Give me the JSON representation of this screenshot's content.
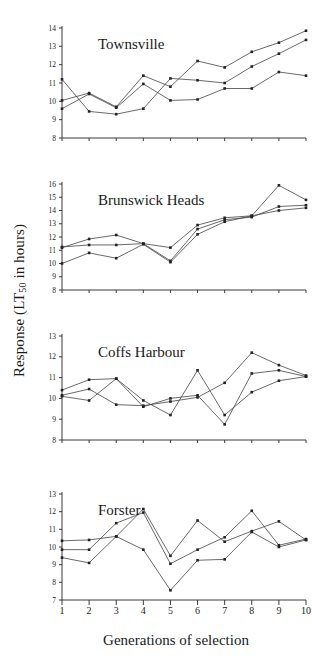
{
  "figure": {
    "ylabel_prefix": "Response (LT",
    "ylabel_sub": "50",
    "ylabel_suffix": " in hours)",
    "xlabel": "Generations of selection"
  },
  "chart_data": [
    {
      "type": "line",
      "title": "Townsville",
      "xlabel": "Generations of selection",
      "ylabel": "Response (LT50 in hours)",
      "x": [
        1,
        2,
        3,
        4,
        5,
        6,
        7,
        8,
        9,
        10
      ],
      "xlim": [
        1,
        10
      ],
      "ylim": [
        8,
        14
      ],
      "yticks": [
        8,
        9,
        10,
        11,
        12,
        13,
        14
      ],
      "xticks": [
        1,
        2,
        3,
        4,
        5,
        6,
        7,
        8,
        9,
        10
      ],
      "grid": false,
      "legend": "none",
      "series": [
        {
          "name": "line-1",
          "values": [
            11.2,
            9.45,
            9.3,
            9.6,
            11.25,
            11.15,
            11.0,
            11.9,
            12.6,
            13.35
          ]
        },
        {
          "name": "line-2",
          "values": [
            10.05,
            10.45,
            9.7,
            11.4,
            10.8,
            12.2,
            11.85,
            12.7,
            13.2,
            13.85
          ]
        },
        {
          "name": "line-3",
          "values": [
            9.6,
            10.4,
            9.65,
            10.95,
            10.05,
            10.1,
            10.7,
            10.7,
            11.6,
            11.4
          ]
        }
      ]
    },
    {
      "type": "line",
      "title": "Brunswick Heads",
      "xlabel": "Generations of selection",
      "ylabel": "Response (LT50 in hours)",
      "x": [
        1,
        2,
        3,
        4,
        5,
        6,
        7,
        8,
        9,
        10
      ],
      "xlim": [
        1,
        10
      ],
      "ylim": [
        8,
        16
      ],
      "yticks": [
        8,
        9,
        10,
        11,
        12,
        13,
        14,
        15,
        16
      ],
      "xticks": [
        1,
        2,
        3,
        4,
        5,
        6,
        7,
        8,
        9,
        10
      ],
      "grid": false,
      "legend": "none",
      "series": [
        {
          "name": "line-1",
          "values": [
            11.2,
            11.85,
            12.15,
            11.5,
            11.2,
            12.9,
            13.45,
            13.6,
            15.9,
            14.8
          ]
        },
        {
          "name": "line-2",
          "values": [
            11.25,
            11.4,
            11.4,
            11.5,
            10.2,
            12.6,
            13.3,
            13.5,
            14.3,
            14.4
          ]
        },
        {
          "name": "line-3",
          "values": [
            10.0,
            10.8,
            10.4,
            11.45,
            10.1,
            12.2,
            13.15,
            13.6,
            14.0,
            14.2
          ]
        }
      ]
    },
    {
      "type": "line",
      "title": "Coffs Harbour",
      "xlabel": "Generations of selection",
      "ylabel": "Response (LT50 in hours)",
      "x": [
        1,
        2,
        3,
        4,
        5,
        6,
        7,
        8,
        9,
        10
      ],
      "xlim": [
        1,
        10
      ],
      "ylim": [
        8,
        13
      ],
      "yticks": [
        8,
        9,
        10,
        11,
        12,
        13
      ],
      "xticks": [
        1,
        2,
        3,
        4,
        5,
        6,
        7,
        8,
        9,
        10
      ],
      "grid": false,
      "legend": "none",
      "series": [
        {
          "name": "line-1",
          "values": [
            10.4,
            10.9,
            10.95,
            9.9,
            9.2,
            11.35,
            9.2,
            10.3,
            10.85,
            11.05
          ]
        },
        {
          "name": "line-2",
          "values": [
            10.15,
            10.45,
            9.7,
            9.65,
            9.85,
            10.05,
            10.75,
            12.2,
            11.6,
            11.1
          ]
        },
        {
          "name": "line-3",
          "values": [
            10.1,
            9.9,
            10.95,
            9.6,
            10.0,
            10.15,
            8.75,
            11.2,
            11.35,
            11.05
          ]
        }
      ]
    },
    {
      "type": "line",
      "title": "Forster",
      "xlabel": "Generations of selection",
      "ylabel": "Response (LT50 in hours)",
      "x": [
        1,
        2,
        3,
        4,
        5,
        6,
        7,
        8,
        9,
        10
      ],
      "xlim": [
        1,
        10
      ],
      "ylim": [
        7,
        13
      ],
      "yticks": [
        7,
        8,
        9,
        10,
        11,
        12,
        13
      ],
      "xticks": [
        1,
        2,
        3,
        4,
        5,
        6,
        7,
        8,
        9,
        10
      ],
      "grid": false,
      "legend": "none",
      "series": [
        {
          "name": "line-1",
          "values": [
            10.35,
            10.4,
            10.6,
            12.15,
            9.5,
            11.5,
            10.3,
            10.9,
            11.45,
            10.4
          ]
        },
        {
          "name": "line-2",
          "values": [
            9.85,
            9.85,
            11.35,
            11.95,
            9.05,
            9.85,
            10.55,
            12.05,
            10.1,
            10.45
          ]
        },
        {
          "name": "line-3",
          "values": [
            9.4,
            9.1,
            10.6,
            9.85,
            7.55,
            9.25,
            9.3,
            10.85,
            10.0,
            10.4
          ]
        }
      ]
    }
  ],
  "panels_layout": [
    {
      "title_dx": 36,
      "title_dy": 14
    },
    {
      "title_dx": 36,
      "title_dy": 14
    },
    {
      "title_dx": 36,
      "title_dy": 14
    },
    {
      "title_dx": 36,
      "title_dy": 14
    }
  ]
}
